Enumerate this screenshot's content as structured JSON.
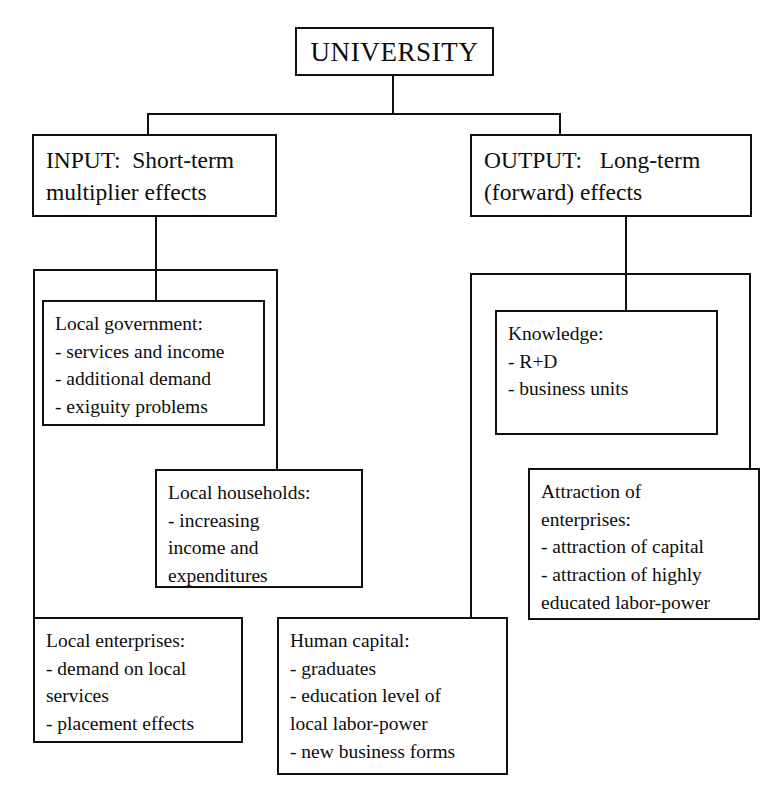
{
  "diagram": {
    "colors": {
      "line": "#101010",
      "background": "#ffffff",
      "text": "#0d0d0d"
    },
    "root": {
      "label": "UNIVERSITY"
    },
    "branches": {
      "input": {
        "line1": "INPUT:  Short-term",
        "line2": "multiplier effects"
      },
      "output": {
        "line1": "OUTPUT:   Long-term",
        "line2": "(forward) effects"
      }
    },
    "leaves": {
      "local_government": {
        "heading": "Local government:",
        "items": [
          "- services and income",
          "- additional demand",
          "- exiguity problems"
        ]
      },
      "local_households": {
        "heading": "Local households:",
        "items": [
          "-            increasing",
          "income              and",
          "expenditures"
        ]
      },
      "local_enterprises": {
        "heading": "Local enterprises:",
        "items": [
          "- demand  on  local",
          "services",
          "- placement effects"
        ]
      },
      "human_capital": {
        "heading": "Human capital:",
        "items": [
          "- graduates",
          "-  education  level  of",
          "local labor-power",
          "- new business forms"
        ]
      },
      "knowledge": {
        "heading": "Knowledge:",
        "items": [
          "- R+D",
          "- business units"
        ]
      },
      "attraction": {
        "heading": "Attraction              of",
        "items": [
          "enterprises:",
          "- attraction of capital",
          "-  attraction  of  highly",
          "educated labor-power"
        ]
      }
    }
  }
}
